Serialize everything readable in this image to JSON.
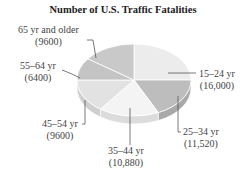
{
  "chart_data": {
    "type": "pie",
    "title": "Number of U.S. Traffic Fatalities",
    "three_d": true,
    "categories": [
      "15–24 yr",
      "25–34 yr",
      "35–44 yr",
      "45–54 yr",
      "55–64 yr",
      "65 yr and older"
    ],
    "values": [
      16000,
      11520,
      10880,
      9600,
      6400,
      9600
    ],
    "value_labels": [
      "(16,000)",
      "(11,520)",
      "(10,880)",
      "(9600)",
      "(6400)",
      "(9600)"
    ],
    "colors": [
      "#ececec",
      "#bdbdbd",
      "#f4f4f4",
      "#e2e2e2",
      "#c4c4c4",
      "#c9c9c9"
    ],
    "side_colors": [
      "#d0d0d0",
      "#a9a9a9",
      "#dcdcdc",
      "#cfcfcf",
      "#b0b0b0",
      "#b5b5b5"
    ],
    "legend": "none (callout labels)"
  },
  "labels": {
    "s0_name": "15–24 yr",
    "s0_val": "(16,000)",
    "s1_name": "25–34 yr",
    "s1_val": "(11,520)",
    "s2_name": "35–44 yr",
    "s2_val": "(10,880)",
    "s3_name": "45–54 yr",
    "s3_val": "(9600)",
    "s4_name": "55–64 yr",
    "s4_val": "(6400)",
    "s5_name": "65 yr and older",
    "s5_val": "(9600)"
  }
}
